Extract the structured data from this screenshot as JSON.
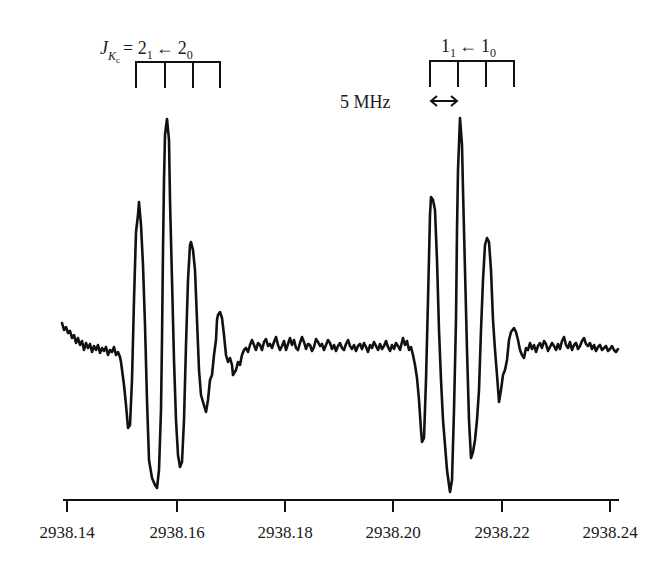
{
  "chart_data": {
    "type": "line",
    "title": "",
    "xlabel": "",
    "ylabel": "",
    "xlim": [
      2938.14,
      2938.24
    ],
    "grid": false,
    "legend": null,
    "x_ticks": [
      "2938.14",
      "2938.16",
      "2938.18",
      "2938.20",
      "2938.22",
      "2938.24"
    ],
    "series": [
      {
        "name": "spectrum",
        "x_approx": [
          2938.14,
          2938.151,
          2938.153,
          2938.155,
          2938.158,
          2938.16,
          2938.162,
          2938.165,
          2938.167,
          2938.17,
          2938.172,
          2938.18,
          2938.19,
          2938.2,
          2938.205,
          2938.207,
          2938.209,
          2938.212,
          2938.214,
          2938.216,
          2938.219,
          2938.221,
          2938.224,
          2938.226,
          2938.24
        ],
        "y_relative": [
          0.25,
          0.0,
          -0.55,
          0.95,
          -1.0,
          1.5,
          -0.85,
          0.7,
          -0.45,
          0.25,
          -0.15,
          0.05,
          0.0,
          0.05,
          0.0,
          -0.6,
          1.0,
          -1.0,
          1.5,
          -0.75,
          0.8,
          -0.35,
          0.15,
          0.0,
          0.0
        ]
      }
    ],
    "annotations": [
      {
        "text_main": "J",
        "text_sub": "Kc",
        "text_rest": " = 2",
        "sub1": "1",
        "arrow": " ← 2",
        "sub2": "0",
        "group": "left"
      },
      {
        "text": "1",
        "sub1": "1",
        "arrow": " ← 1",
        "sub2": "0",
        "group": "right"
      },
      {
        "text": "5 MHz",
        "scale_bar": "↔"
      }
    ]
  },
  "labels": {
    "left_J": "J",
    "left_Kc": "K",
    "left_c": "c",
    "left_eq": "= 2",
    "left_sub1": "1",
    "left_arrow": "←",
    "left_2": "2",
    "left_sub0": "0",
    "right_1": "1",
    "right_sub1": "1",
    "right_arrow": "←",
    "right_1b": "1",
    "right_sub0": "0",
    "scale_text": "5 MHz"
  },
  "ticks": [
    {
      "label": "2938.14",
      "x": 67
    },
    {
      "label": "2938.16",
      "x": 177
    },
    {
      "label": "2938.18",
      "x": 285
    },
    {
      "label": "2938.20",
      "x": 393
    },
    {
      "label": "2938.22",
      "x": 502
    },
    {
      "label": "2938.24",
      "x": 610
    }
  ],
  "trace_points": "62,323 64,330 66,327 68,333 70,331 72,338 74,335 76,343 78,338 80,345 82,341 84,350 86,343 88,348 90,344 92,352 94,346 96,350 98,345 100,353 102,348 104,351 106,347 108,355 110,350 112,352 114,347 116,355 118,352 120,357 121,362 124,385 126,405 128,428 130,425 132,380 134,300 136,232 138,215 139,202 141,225 143,265 145,325 147,400 149,460 152,478 155,485 157,488 159,470 161,410 162,340 163,250 164,180 165,135 167,119 169,140 170,200 172,280 174,360 176,420 178,455 180,467 182,462 184,420 186,345 188,280 190,245 191,242 193,250 195,270 197,320 199,370 201,395 203,402 206,412 208,400 210,380 212,375 214,355 216,340 217,320 218,315 220,312 222,318 224,335 226,355 228,362 230,358 232,365 233,375 236,370 238,362 240,365 242,355 244,350 246,348 248,352 250,345 252,340 254,345 256,350 258,343 260,345 262,350 264,342 266,339 268,346 270,344 272,348 274,342 276,337 278,345 280,350 282,346 284,341 286,350 288,344 290,338 292,345 294,340 296,348 298,350 300,343 302,337 304,342 306,349 308,344 310,345 312,351 314,347 316,339 318,342 320,346 322,344 324,350 326,345 328,340 330,343 332,349 334,345 336,351 338,346 340,343 342,348 344,350 346,344 348,340 350,346 352,349 354,345 356,351 358,346 360,344 362,349 364,343 366,347 368,352 370,345 372,348 374,342 376,346 378,350 380,344 382,349 384,346 386,341 388,347 390,351 392,345 394,349 396,343 398,346 400,350 403,338 405,345 407,341 409,350 411,347 413,355 415,365 417,378 419,400 421,430 422,442 424,438 426,380 428,300 430,215 431,197 433,200 435,210 437,260 439,330 441,380 443,420 445,445 447,470 449,485 450,492 452,480 454,410 456,320 457,230 458,170 460,118 462,145 463,190 465,270 467,350 469,420 471,458 473,452 475,440 477,420 479,390 481,330 483,280 485,245 487,238 489,242 491,270 493,320 495,350 497,375 499,402 501,390 503,375 505,370 507,360 509,340 511,332 514,328 516,332 518,340 520,350 522,355 524,358 526,348 528,350 530,343 532,349 534,345 536,352 538,346 540,343 542,348 544,341 546,344 548,351 550,347 552,343 554,346 556,350 558,344 560,349 562,341 564,337 566,345 568,348 570,342 572,350 574,345 576,343 578,349 580,346 582,341 584,338 586,344 588,346 590,343 592,349 594,345 596,351 598,347 600,345 602,350 604,348 606,346 608,351 610,349 612,346 614,350 616,352 618,349"
}
